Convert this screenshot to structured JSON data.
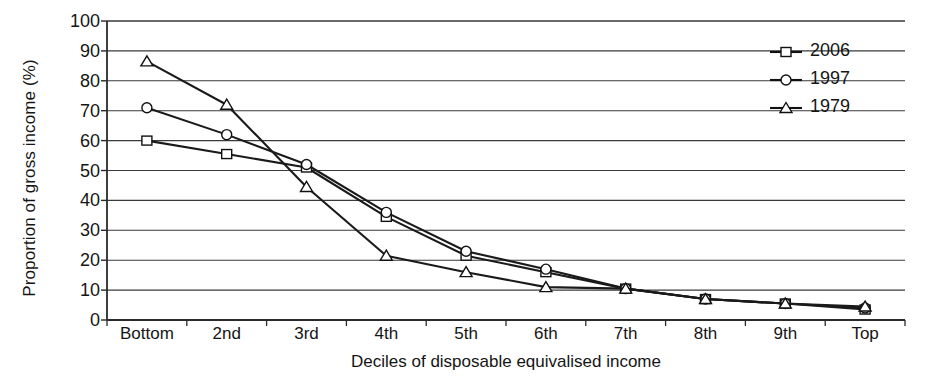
{
  "chart_data": {
    "type": "line",
    "title": "",
    "xlabel": "Deciles of disposable equivalised income",
    "ylabel": "Proportion of gross income (%)",
    "categories": [
      "Bottom",
      "2nd",
      "3rd",
      "4th",
      "5th",
      "6th",
      "7th",
      "8th",
      "9th",
      "Top"
    ],
    "ylim": [
      0,
      100
    ],
    "yticks": [
      "0",
      "10",
      "20",
      "30",
      "40",
      "50",
      "60",
      "70",
      "80",
      "90",
      "100"
    ],
    "grid": "horizontal",
    "legend_position": "top-right",
    "series": [
      {
        "name": "2006",
        "marker": "square",
        "color": "#1a1a1a",
        "values": [
          60,
          55.5,
          51,
          34.5,
          21.5,
          16,
          10.5,
          7,
          5.5,
          3.5
        ]
      },
      {
        "name": "1997",
        "marker": "circle",
        "color": "#1a1a1a",
        "values": [
          71,
          62,
          52,
          36,
          23,
          17,
          10.5,
          7,
          5.5,
          4
        ]
      },
      {
        "name": "1979",
        "marker": "triangle",
        "color": "#1a1a1a",
        "values": [
          86.5,
          72,
          44.5,
          21.5,
          16,
          11,
          10.5,
          7,
          5.5,
          4.5
        ]
      }
    ]
  },
  "legend": {
    "items": [
      {
        "label": "2006",
        "marker": "square"
      },
      {
        "label": "1997",
        "marker": "circle"
      },
      {
        "label": "1979",
        "marker": "triangle"
      }
    ]
  },
  "axes": {
    "y_title": "Proportion of gross income (%)",
    "x_title": "Deciles of disposable equivalised income"
  }
}
